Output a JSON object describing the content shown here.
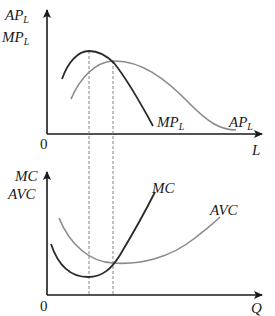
{
  "diagram": {
    "top_panel": {
      "y_axis_label_line1": "AP",
      "y_axis_label_line1_sub": "L",
      "y_axis_label_line2": "MP",
      "y_axis_label_line2_sub": "L",
      "x_axis_label": "L",
      "origin_label": "0",
      "curves": [
        {
          "name": "MP",
          "sub": "L",
          "color": "#2a2a2a"
        },
        {
          "name": "AP",
          "sub": "L",
          "color": "#8a8a8a"
        }
      ]
    },
    "bottom_panel": {
      "y_axis_label_line1": "MC",
      "y_axis_label_line2": "AVC",
      "x_axis_label": "Q",
      "origin_label": "0",
      "curves": [
        {
          "name": "MC",
          "color": "#2a2a2a"
        },
        {
          "name": "AVC",
          "color": "#8a8a8a"
        }
      ]
    },
    "guide_lines": "dashed verticals linking MP peak to MC minimum and AP/MP intersection to AVC/MC intersection"
  },
  "colors": {
    "axis": "#1a1a1a",
    "dark_curve": "#2a2a2a",
    "light_curve": "#8a8a8a",
    "dashed": "#777777"
  }
}
